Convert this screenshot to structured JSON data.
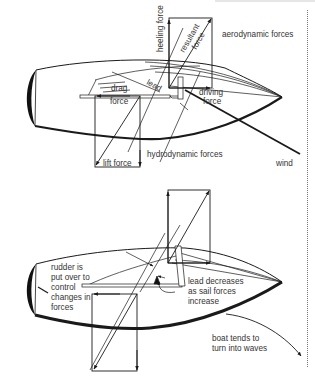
{
  "diagram": {
    "top_panel": {
      "labels": {
        "heeling_force": "heeling force",
        "resultant_force_line1": "resultant",
        "resultant_force_line2": "force",
        "aerodynamic_forces": "aerodynamic forces",
        "drag_line1": "drag",
        "drag_line2": "force",
        "lead": "lead",
        "driving_line1": "driving",
        "driving_line2": "force",
        "lift_force": "lift force",
        "hydrodynamic_forces": "hydrodynamic forces",
        "wind": "wind"
      }
    },
    "bottom_panel": {
      "labels": {
        "rudder_line1": "rudder is",
        "rudder_line2": "put over to",
        "rudder_line3": "control",
        "rudder_line4": "changes in",
        "rudder_line5": "forces",
        "lead_line1": "lead decreases",
        "lead_line2": "as sail forces",
        "lead_line3": "increase",
        "turn_line1": "boat tends to",
        "turn_line2": "turn into waves"
      }
    },
    "colors": {
      "ink": "#1a1a1a",
      "text": "#333333",
      "background": "#ffffff"
    }
  }
}
